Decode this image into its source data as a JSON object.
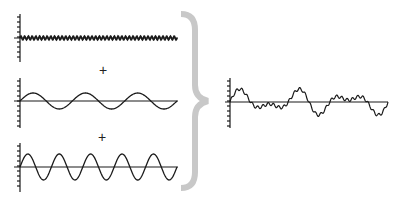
{
  "diagram": {
    "operator_symbols": [
      "+",
      "+"
    ],
    "components": [
      {
        "name": "high-frequency-wave",
        "cycles": 42,
        "amplitude_px": 2,
        "baseline_y": 38
      },
      {
        "name": "low-frequency-wave",
        "cycles": 3,
        "amplitude_px": 8,
        "baseline_y": 101
      },
      {
        "name": "mid-frequency-wave",
        "cycles": 5,
        "amplitude_px": 13,
        "baseline_y": 167
      }
    ],
    "result": {
      "name": "sum-wave",
      "baseline_y": 101
    },
    "colors": {
      "line": "#1a1a1a",
      "brace": "#c8c8c8",
      "background": "#ffffff"
    }
  }
}
